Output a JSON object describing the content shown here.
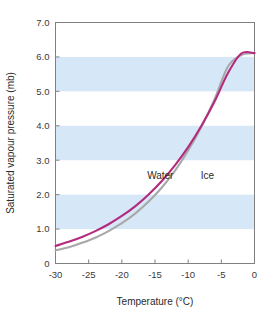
{
  "chart_data": {
    "type": "line",
    "title": "",
    "xlabel": "Temperature (°C)",
    "ylabel": "Saturated vapour pressure (mb)",
    "xlim": [
      -30,
      0
    ],
    "ylim": [
      0,
      7.0
    ],
    "xticks": [
      -30,
      -25,
      -20,
      -15,
      -10,
      -5,
      0
    ],
    "xticklabels": [
      "-30",
      "-25",
      "-20",
      "-15",
      "-10",
      "-5",
      "0"
    ],
    "yticks": [
      0,
      1.0,
      2.0,
      3.0,
      4.0,
      5.0,
      6.0,
      7.0
    ],
    "yticklabels": [
      "0",
      "1.0",
      "2.0",
      "3.0",
      "4.0",
      "5.0",
      "6.0",
      "7.0"
    ],
    "grid": false,
    "legend_position": "inline-annotation",
    "banding": {
      "color": "#d6e8f8",
      "orientation": "horizontal",
      "ranges": [
        [
          1.0,
          2.0
        ],
        [
          3.0,
          4.0
        ],
        [
          5.0,
          6.0
        ]
      ]
    },
    "x": [
      -30,
      -28,
      -26,
      -24,
      -22,
      -20,
      -18,
      -16,
      -14,
      -12,
      -10,
      -8,
      -6,
      -4,
      -2,
      0
    ],
    "series": [
      {
        "name": "Water",
        "color": "#b32a7e",
        "label": "Water",
        "label_x": -14.2,
        "label_y": 2.45,
        "values": [
          0.51,
          0.63,
          0.77,
          0.94,
          1.14,
          1.38,
          1.66,
          2.0,
          2.39,
          2.85,
          3.38,
          4.0,
          4.71,
          5.53,
          6.1,
          6.11
        ]
      },
      {
        "name": "Ice",
        "color": "#a8a8a8",
        "label": "Ice",
        "label_x": -7.1,
        "label_y": 2.45,
        "values": [
          0.38,
          0.47,
          0.6,
          0.75,
          0.94,
          1.17,
          1.45,
          1.79,
          2.2,
          2.69,
          3.28,
          3.97,
          4.78,
          5.72,
          6.05,
          6.11
        ]
      }
    ],
    "annotations": [
      {
        "text": "Water",
        "x": -14.2,
        "y": 2.45
      },
      {
        "text": "Ice",
        "x": -7.1,
        "y": 2.45
      }
    ]
  },
  "axes": {
    "frame_color": "#808080",
    "tick_color": "#808080",
    "x_title": "Temperature (°C)",
    "y_title": "Saturated vapour pressure (mb)",
    "x_tick_labels": [
      "-30",
      "-25",
      "-20",
      "-15",
      "-10",
      "-5",
      "0"
    ],
    "y_tick_labels": [
      "0",
      "1.0",
      "2.0",
      "3.0",
      "4.0",
      "5.0",
      "6.0",
      "7.0"
    ]
  },
  "colors": {
    "background": "#ffffff",
    "band": "#d6e8f8",
    "water": "#b32a7e",
    "ice": "#a8a8a8",
    "frame": "#808080",
    "text": "#2b2b2b"
  }
}
